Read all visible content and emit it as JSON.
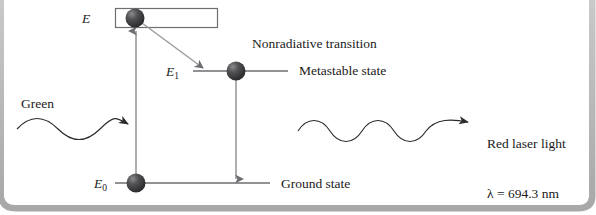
{
  "figure": {
    "title_hidden": "",
    "background_color": "#ffffff",
    "frame": {
      "shadow_color": "#b3b3b3",
      "corner_style": "rounded-bottom"
    },
    "stroke_color": "#58585a",
    "text_color": "#1a1a1a"
  },
  "levels": {
    "excited_band": {
      "symbol": "E",
      "name": "excited-energy-band",
      "x": 115,
      "y": 8,
      "width": 103,
      "height": 20
    },
    "metastable": {
      "symbol": "E",
      "subscript": "1",
      "label": "Metastable state",
      "x1": 193,
      "x2": 288,
      "y": 71
    },
    "ground": {
      "symbol": "E",
      "subscript": "0",
      "label": "Ground state",
      "x1": 115,
      "x2": 270,
      "y": 183
    }
  },
  "annotations": {
    "nonradiative": "Nonradiative transition",
    "pump_label": "Green",
    "emission_label": "Red laser light",
    "emission_wavelength": "λ = 694.3 nm"
  },
  "electrons": [
    {
      "name": "electron-excited",
      "cx": 135,
      "cy": 18,
      "r": 9.5
    },
    {
      "name": "electron-metastable",
      "cx": 236,
      "cy": 71,
      "r": 9.5
    },
    {
      "name": "electron-ground",
      "cx": 136,
      "cy": 183,
      "r": 9.5
    }
  ],
  "arrows": {
    "pump_excitation": {
      "name": "pump-excitation-arrow",
      "x": 136,
      "y_from": 182,
      "y_to": 27
    },
    "nonradiative_decay": {
      "name": "nonradiative-decay-arrow",
      "x1": 143,
      "y1": 23,
      "x2": 205,
      "y2": 69
    },
    "laser_emission_down": {
      "name": "stimulated-emission-arrow",
      "x": 236,
      "y_from": 80,
      "y_to": 184
    }
  },
  "waves": {
    "green_input": {
      "name": "green-light-wave",
      "x_start": 17,
      "x_end": 127,
      "y": 129,
      "cycles": 2
    },
    "red_output": {
      "name": "red-laser-wave",
      "x_start": 298,
      "x_end": 478,
      "y": 122,
      "cycles": 3
    }
  }
}
